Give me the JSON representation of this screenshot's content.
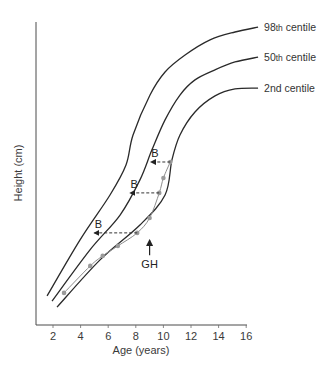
{
  "chart_data": {
    "type": "line",
    "title": "",
    "xlabel": "Age (years)",
    "ylabel": "Height (cm)",
    "xlim": [
      0.8,
      16.2
    ],
    "ylim": [
      0,
      100
    ],
    "y_units_note": "relative scale, no y tick labels shown",
    "x_ticks": [
      2,
      4,
      6,
      8,
      10,
      12,
      14,
      16
    ],
    "grid": false,
    "series": [
      {
        "name": "98th centile",
        "label_main": "98",
        "label_sup": "th",
        "label_rest": " centile",
        "points": [
          [
            1.57,
            9.6
          ],
          [
            3.96,
            28.1
          ],
          [
            6.13,
            42.9
          ],
          [
            7.29,
            52.8
          ],
          [
            7.8,
            62.7
          ],
          [
            9.03,
            75.9
          ],
          [
            10.12,
            83.5
          ],
          [
            11.57,
            89.1
          ],
          [
            13.38,
            94.1
          ],
          [
            15.19,
            96.7
          ],
          [
            16.86,
            98.3
          ]
        ]
      },
      {
        "name": "50th centile",
        "label_main": "50",
        "label_sup": "th",
        "label_rest": " centile",
        "points": [
          [
            1.93,
            7.9
          ],
          [
            4.68,
            24.8
          ],
          [
            6.86,
            36.3
          ],
          [
            8.3,
            47.9
          ],
          [
            9.17,
            57.8
          ],
          [
            10.12,
            67.7
          ],
          [
            11.2,
            75.9
          ],
          [
            12.29,
            80.9
          ],
          [
            13.74,
            84.2
          ],
          [
            15.19,
            86.8
          ],
          [
            16.86,
            88.4
          ]
        ]
      },
      {
        "name": "2nd centile",
        "label_main": "2nd centile",
        "label_sup": "",
        "label_rest": "",
        "points": [
          [
            2.29,
            5.9
          ],
          [
            5.41,
            21.5
          ],
          [
            8.3,
            33.0
          ],
          [
            10.12,
            42.9
          ],
          [
            10.62,
            54.5
          ],
          [
            11.2,
            62.7
          ],
          [
            12.29,
            70.3
          ],
          [
            13.74,
            75.6
          ],
          [
            15.19,
            77.9
          ],
          [
            16.86,
            78.2
          ]
        ]
      }
    ],
    "patient": {
      "name": "Patient height measurements",
      "points": [
        [
          2.8,
          10.6
        ],
        [
          4.7,
          19.5
        ],
        [
          5.6,
          22.8
        ],
        [
          6.7,
          26.1
        ],
        [
          8.1,
          30.4
        ],
        [
          9.0,
          35.3
        ],
        [
          9.7,
          43.6
        ],
        [
          10.0,
          48.5
        ],
        [
          10.5,
          53.8
        ]
      ]
    },
    "bone_age_arrows": [
      {
        "label": "B",
        "from_age": 10.5,
        "to_age": 9.1,
        "height": 53.8
      },
      {
        "label": "B",
        "from_age": 9.7,
        "to_age": 7.6,
        "height": 43.6
      },
      {
        "label": "B",
        "from_age": 8.1,
        "to_age": 5.0,
        "height": 30.4
      }
    ],
    "gh_marker": {
      "label": "GH",
      "age": 9.0,
      "height_from": 23.0,
      "height_to": 28.0
    }
  }
}
